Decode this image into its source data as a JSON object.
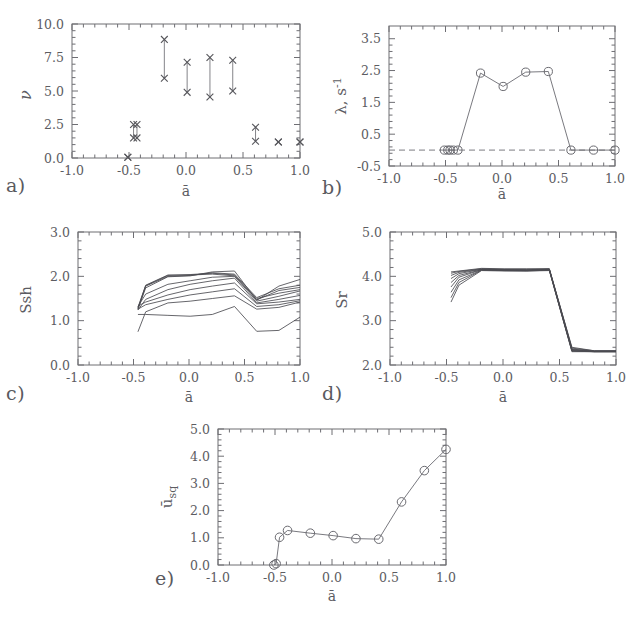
{
  "figure": {
    "title": "",
    "panel_labels": [
      "a)",
      "b)",
      "c)",
      "d)",
      "e)"
    ]
  },
  "labels": {
    "a": "a)",
    "b": "b)",
    "c": "c)",
    "d": "d)",
    "e": "e)"
  },
  "axis_text": {
    "xlabel": "ā",
    "ylabel_a": "ν",
    "ylabel_b_lambda": "λ, s",
    "ylabel_b_exp": "-1",
    "ylabel_c": "Ssh",
    "ylabel_d": "Sr",
    "ylabel_e_main": "ū",
    "ylabel_e_sub": "sq"
  },
  "xticks": {
    "values": [
      -1.0,
      -0.5,
      0.0,
      0.5,
      1.0
    ],
    "labels": [
      "-1.0",
      "-0.5",
      "0.0",
      "0.5",
      "1.0"
    ]
  },
  "chart_data": [
    {
      "id": "panel-a",
      "type": "scatter",
      "title": "a)",
      "xlabel": "ā",
      "ylabel": "ν",
      "xlim": [
        -1.0,
        1.0
      ],
      "ylim": [
        0.0,
        10.0
      ],
      "yticks": [
        0.0,
        2.5,
        5.0,
        7.5,
        10.0
      ],
      "yticklabels": [
        "0.0",
        "2.5",
        "5.0",
        "7.5",
        "10.0"
      ],
      "xticks": [
        -1.0,
        -0.5,
        0.0,
        0.5,
        1.0
      ],
      "grid": false,
      "legend": "none",
      "marker": "x",
      "note": "Vertical ranges: each x has a low and high nu value joined by a line, endpoints drawn as x markers.",
      "ranges": [
        {
          "x": -0.51,
          "low": 0.05,
          "high": 0.05
        },
        {
          "x": -0.46,
          "low": 1.5,
          "high": 2.5
        },
        {
          "x": -0.43,
          "low": 1.5,
          "high": 2.5
        },
        {
          "x": -0.19,
          "low": 5.95,
          "high": 8.85
        },
        {
          "x": 0.01,
          "low": 4.9,
          "high": 7.15
        },
        {
          "x": 0.21,
          "low": 4.55,
          "high": 7.5
        },
        {
          "x": 0.41,
          "low": 5.0,
          "high": 7.3
        },
        {
          "x": 0.61,
          "low": 1.25,
          "high": 2.3
        },
        {
          "x": 0.81,
          "low": 1.2,
          "high": 1.2
        },
        {
          "x": 1.0,
          "low": 1.2,
          "high": 1.2
        }
      ]
    },
    {
      "id": "panel-b",
      "type": "line",
      "title": "b)",
      "xlabel": "ā",
      "ylabel": "λ, s^-1",
      "xlim": [
        -1.0,
        1.0
      ],
      "ylim": [
        -0.5,
        3.9
      ],
      "yticks": [
        -0.5,
        0.5,
        1.5,
        2.5,
        3.5
      ],
      "yticklabels": [
        "-0.5",
        "0.5",
        "1.5",
        "2.5",
        "3.5"
      ],
      "xticks": [
        -1.0,
        -0.5,
        0.0,
        0.5,
        1.0
      ],
      "grid": false,
      "legend": "none",
      "marker": "circle",
      "reference_line": {
        "y": 0.0,
        "style": "dashed"
      },
      "x": [
        -0.51,
        -0.48,
        -0.46,
        -0.43,
        -0.39,
        -0.19,
        0.01,
        0.21,
        0.41,
        0.61,
        0.81,
        1.0
      ],
      "y": [
        0.0,
        0.0,
        0.0,
        0.0,
        0.0,
        2.42,
        2.0,
        2.45,
        2.47,
        0.0,
        0.0,
        0.0
      ]
    },
    {
      "id": "panel-c",
      "type": "line",
      "title": "c)",
      "xlabel": "ā",
      "ylabel": "Ssh",
      "xlim": [
        -1.0,
        1.0
      ],
      "ylim": [
        0.0,
        3.0
      ],
      "yticks": [
        0.0,
        1.0,
        2.0,
        3.0
      ],
      "yticklabels": [
        "0.0",
        "1.0",
        "2.0",
        "3.0"
      ],
      "xticks": [
        -1.0,
        -0.5,
        0.0,
        0.5,
        1.0
      ],
      "grid": false,
      "legend": "none",
      "x": [
        -0.46,
        -0.39,
        -0.19,
        0.01,
        0.21,
        0.41,
        0.61,
        0.81,
        1.0
      ],
      "series": [
        {
          "name": "run-1",
          "values": [
            1.3,
            1.8,
            2.03,
            2.03,
            2.05,
            2.01,
            1.5,
            1.62,
            1.7
          ]
        },
        {
          "name": "run-2",
          "values": [
            1.28,
            1.79,
            2.02,
            2.04,
            2.07,
            2.03,
            1.47,
            1.68,
            1.75
          ]
        },
        {
          "name": "run-3",
          "values": [
            1.25,
            1.78,
            2.0,
            2.02,
            2.08,
            2.05,
            1.52,
            1.72,
            1.8
          ]
        },
        {
          "name": "run-4",
          "values": [
            1.27,
            1.74,
            1.99,
            2.01,
            2.1,
            2.12,
            1.46,
            1.78,
            1.93
          ]
        },
        {
          "name": "run-5",
          "values": [
            1.32,
            1.6,
            1.82,
            1.9,
            1.98,
            2.0,
            1.44,
            1.55,
            1.67
          ]
        },
        {
          "name": "run-6",
          "values": [
            1.24,
            1.48,
            1.7,
            1.82,
            1.9,
            1.96,
            1.4,
            1.48,
            1.57
          ]
        },
        {
          "name": "run-7",
          "values": [
            1.33,
            1.42,
            1.58,
            1.7,
            1.78,
            1.85,
            1.38,
            1.42,
            1.48
          ]
        },
        {
          "name": "run-8",
          "values": [
            1.26,
            1.36,
            1.48,
            1.58,
            1.65,
            1.72,
            1.32,
            1.36,
            1.45
          ]
        },
        {
          "name": "run-9",
          "values": [
            0.75,
            1.2,
            1.4,
            1.44,
            1.5,
            1.56,
            1.26,
            1.3,
            1.42
          ]
        },
        {
          "name": "run-10",
          "values": [
            1.14,
            1.14,
            1.12,
            1.1,
            1.14,
            1.32,
            0.76,
            0.78,
            1.08
          ]
        }
      ]
    },
    {
      "id": "panel-d",
      "type": "line",
      "title": "d)",
      "xlabel": "ā",
      "ylabel": "Sr",
      "xlim": [
        -1.0,
        1.0
      ],
      "ylim": [
        2.0,
        5.0
      ],
      "yticks": [
        2.0,
        3.0,
        4.0,
        5.0
      ],
      "yticklabels": [
        "2.0",
        "3.0",
        "4.0",
        "5.0"
      ],
      "xticks": [
        -1.0,
        -0.5,
        0.0,
        0.5,
        1.0
      ],
      "grid": false,
      "legend": "none",
      "x": [
        -0.46,
        -0.39,
        -0.19,
        0.01,
        0.21,
        0.41,
        0.61,
        0.81,
        1.0
      ],
      "series": [
        {
          "name": "run-1",
          "values": [
            4.1,
            4.12,
            4.18,
            4.17,
            4.17,
            4.17,
            2.4,
            2.32,
            2.32
          ]
        },
        {
          "name": "run-2",
          "values": [
            4.07,
            4.11,
            4.17,
            4.16,
            4.16,
            4.17,
            2.38,
            2.32,
            2.32
          ]
        },
        {
          "name": "run-3",
          "values": [
            4.02,
            4.09,
            4.16,
            4.15,
            4.15,
            4.16,
            2.36,
            2.31,
            2.31
          ]
        },
        {
          "name": "run-4",
          "values": [
            3.95,
            4.06,
            4.16,
            4.15,
            4.14,
            4.16,
            2.35,
            2.31,
            2.31
          ]
        },
        {
          "name": "run-5",
          "values": [
            3.86,
            4.02,
            4.15,
            4.14,
            4.14,
            4.15,
            2.34,
            2.31,
            2.31
          ]
        },
        {
          "name": "run-6",
          "values": [
            3.76,
            3.98,
            4.15,
            4.14,
            4.13,
            4.15,
            2.33,
            2.3,
            2.3
          ]
        },
        {
          "name": "run-7",
          "values": [
            3.64,
            3.92,
            4.14,
            4.13,
            4.13,
            4.14,
            2.32,
            2.3,
            2.3
          ]
        },
        {
          "name": "run-8",
          "values": [
            3.52,
            3.86,
            4.14,
            4.13,
            4.12,
            4.14,
            2.31,
            2.3,
            2.3
          ]
        },
        {
          "name": "run-9",
          "values": [
            3.42,
            3.8,
            4.13,
            4.12,
            4.12,
            4.13,
            2.3,
            2.3,
            2.3
          ]
        }
      ]
    },
    {
      "id": "panel-e",
      "type": "line",
      "title": "e)",
      "xlabel": "ā",
      "ylabel": "ū_sq",
      "xlim": [
        -1.0,
        1.0
      ],
      "ylim": [
        0.0,
        5.0
      ],
      "yticks": [
        0.0,
        1.0,
        2.0,
        3.0,
        4.0,
        5.0
      ],
      "yticklabels": [
        "0.0",
        "1.0",
        "2.0",
        "3.0",
        "4.0",
        "5.0"
      ],
      "xticks": [
        -1.0,
        -0.5,
        0.0,
        0.5,
        1.0
      ],
      "grid": false,
      "legend": "none",
      "marker": "circle",
      "x": [
        -0.51,
        -0.49,
        -0.46,
        -0.39,
        -0.19,
        0.01,
        0.21,
        0.41,
        0.61,
        0.81,
        1.0
      ],
      "y": [
        0.0,
        0.05,
        1.02,
        1.27,
        1.17,
        1.08,
        0.97,
        0.95,
        2.32,
        3.47,
        4.25
      ]
    }
  ]
}
